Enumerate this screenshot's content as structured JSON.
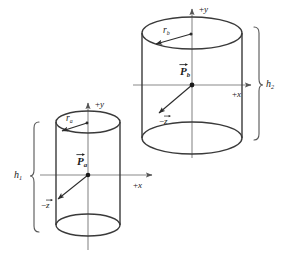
{
  "figure": {
    "stroke_color": "#3a3a3a",
    "axis_color": "#7a7a7a",
    "label_color": "#1a1a1a",
    "background": "#ffffff"
  },
  "cylinder_a": {
    "name": "lower-left cylinder",
    "axis_y_label": "+y",
    "axis_y_sign": "+",
    "axis_y_letter": "y",
    "axis_x_label": "+x",
    "axis_x_sign": "+",
    "axis_x_letter": "x",
    "axis_z_label": "−z",
    "axis_z_sign": "−",
    "axis_z_letter": "z",
    "radius_label": "r",
    "radius_subscript": "a",
    "position_vector_label": "P",
    "position_vector_subscript": "a",
    "height_label": "h",
    "height_subscript": "1"
  },
  "cylinder_b": {
    "name": "upper-right cylinder",
    "axis_y_label": "+y",
    "axis_y_sign": "+",
    "axis_y_letter": "y",
    "axis_x_label": "+x",
    "axis_x_sign": "+",
    "axis_x_letter": "x",
    "axis_z_label": "−z",
    "axis_z_sign": "−",
    "axis_z_letter": "z",
    "radius_label": "r",
    "radius_subscript": "b",
    "position_vector_label": "P",
    "position_vector_subscript": "b",
    "height_label": "h",
    "height_subscript": "2"
  }
}
